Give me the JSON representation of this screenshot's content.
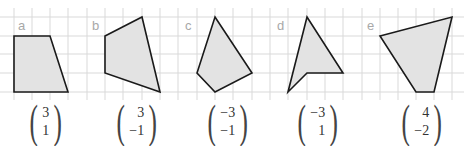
{
  "figures": [
    {
      "label": "a",
      "vector": {
        "top": "3",
        "bottom": "1"
      }
    },
    {
      "label": "b",
      "vector": {
        "top": "3",
        "bottom": "−1"
      }
    },
    {
      "label": "c",
      "vector": {
        "top": "−3",
        "bottom": "−1"
      }
    },
    {
      "label": "d",
      "vector": {
        "top": "−3",
        "bottom": "1"
      }
    },
    {
      "label": "e",
      "vector": {
        "top": "4",
        "bottom": "−2"
      }
    }
  ],
  "colors": {
    "grid": "#d9d9d9",
    "shape_fill": "#e3e3e3",
    "shape_stroke": "#1a1a1a",
    "label": "#a8a8a8"
  }
}
